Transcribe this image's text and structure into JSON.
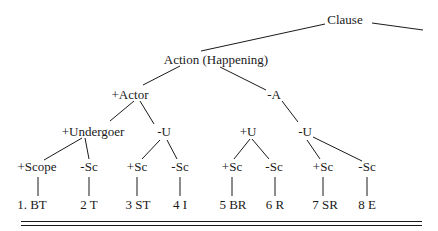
{
  "diagram": {
    "type": "tree",
    "root": "Clause",
    "nodes": {
      "clause": "Clause",
      "action": "Action (Happening)",
      "actor_plus": "+Actor",
      "actor_minus": "-A",
      "undergoer_plus": "+Undergoer",
      "u_minus_left": "-U",
      "u_plus": "+U",
      "u_minus_right": "-U",
      "scope_plus": "+Scope",
      "sc_minus_1": "-Sc",
      "sc_plus_2": "+Sc",
      "sc_minus_2": "-Sc",
      "sc_plus_3": "+Sc",
      "sc_minus_3": "-Sc",
      "sc_plus_4": "+Sc",
      "sc_minus_4": "-Sc"
    },
    "leaves": [
      "1.  BT",
      "2 T",
      "3 ST",
      "4 I",
      "5 BR",
      "6 R",
      "7 SR",
      "8 E"
    ],
    "line_color": "#1a1a1a"
  }
}
